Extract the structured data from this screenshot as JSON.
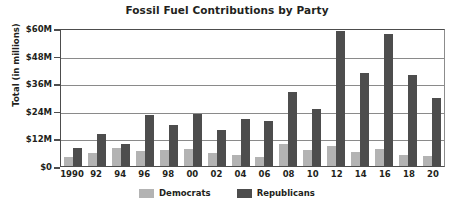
{
  "chart_data": {
    "type": "bar",
    "title": "Fossil Fuel Contributions by Party",
    "xlabel": "",
    "ylabel": "Total (in millions)",
    "categories": [
      "1990",
      "92",
      "94",
      "96",
      "98",
      "00",
      "02",
      "04",
      "06",
      "08",
      "10",
      "12",
      "14",
      "16",
      "18",
      "20"
    ],
    "series": [
      {
        "name": "Democrats",
        "color": "#b3b3b3",
        "values": [
          4.0,
          5.5,
          8.0,
          6.5,
          7.0,
          7.5,
          5.5,
          5.0,
          4.0,
          9.5,
          7.0,
          8.5,
          6.0,
          7.5,
          5.0,
          4.5
        ]
      },
      {
        "name": "Republicans",
        "color": "#4d4d4d",
        "values": [
          8.0,
          14.0,
          9.5,
          22.0,
          18.0,
          22.5,
          15.5,
          20.5,
          19.5,
          32.0,
          25.0,
          58.5,
          40.5,
          57.5,
          39.5,
          29.5
        ]
      }
    ],
    "ylim": [
      0,
      60
    ],
    "yticks": [
      0,
      12,
      24,
      36,
      48,
      60
    ],
    "ytick_labels": [
      "$0",
      "$12M",
      "$24M",
      "$36M",
      "$48M",
      "$60M"
    ],
    "grid": true,
    "legend_position": "bottom-center"
  },
  "legend": {
    "items": [
      {
        "label": "Democrats"
      },
      {
        "label": "Republicans"
      }
    ]
  }
}
